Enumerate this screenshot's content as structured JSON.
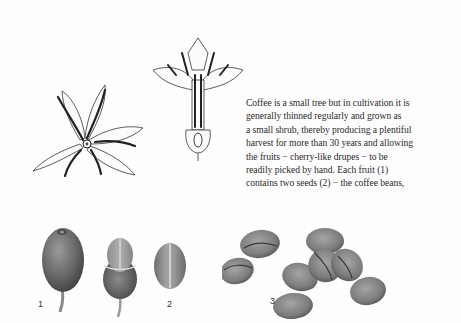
{
  "document": {
    "type": "book page illustration",
    "text_lines": [
      "Coffee is a small tree but in cultivation it is",
      "generally thinned regularly and grown as",
      "a small shrub, thereby producing a plentiful",
      "harvest for more than 30 years and allowing",
      "the fruits − cherry-like drupes − to be",
      "readily picked by hand. Each fruit (1)",
      "contains two seeds (2) − the coffee beans,"
    ],
    "figures": {
      "flower_top_view": {
        "label": ""
      },
      "flower_cross_section": {
        "label": ""
      },
      "fruit": {
        "label": "1"
      },
      "fruit_opened": {
        "label": ""
      },
      "seeds": {
        "label": "2"
      },
      "roasted_beans": {
        "label": "3"
      }
    },
    "colors": {
      "background": "#fefefe",
      "ink": "#2a2a2a",
      "fruit_dark": "#5e5e5e",
      "bean_mid": "#8a8a8a"
    }
  }
}
